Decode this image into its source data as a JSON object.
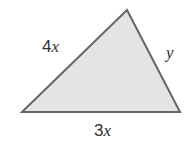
{
  "diagram": {
    "type": "triangle",
    "fill_color": "#e4e4e4",
    "stroke_color": "#666666",
    "vertices": {
      "top": [
        127,
        10
      ],
      "bottom_left": [
        22,
        112
      ],
      "bottom_right": [
        180,
        112
      ]
    },
    "sides": [
      {
        "name": "left",
        "coefficient": "4",
        "variable": "x"
      },
      {
        "name": "right",
        "coefficient": "",
        "variable": "y"
      },
      {
        "name": "bottom",
        "coefficient": "3",
        "variable": "x"
      }
    ]
  }
}
